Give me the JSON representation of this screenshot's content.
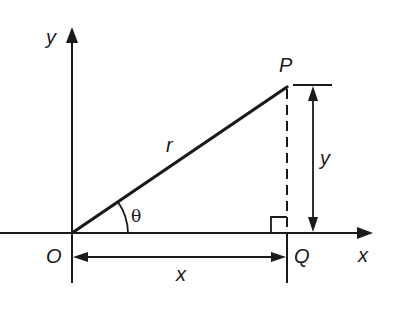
{
  "diagram": {
    "type": "polar-cartesian-relationship",
    "labels": {
      "y_axis": "y",
      "x_axis": "x",
      "origin": "O",
      "point_p": "P",
      "point_q": "Q",
      "radius": "r",
      "angle": "θ",
      "horizontal_distance": "x",
      "vertical_distance": "y"
    },
    "colors": {
      "ink": "#1a1a1a",
      "background": "#ffffff"
    }
  }
}
